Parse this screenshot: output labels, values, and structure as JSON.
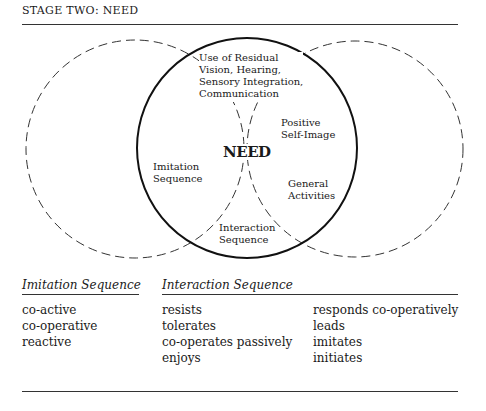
{
  "title": "STAGE TWO: NEED",
  "diagram": {
    "center_label": "NEED",
    "circles": [
      {
        "name": "imitation",
        "cx": 135,
        "cy": 149,
        "r": 109,
        "style": "dashed"
      },
      {
        "name": "need",
        "cx": 247,
        "cy": 148,
        "r": 110,
        "style": "solid"
      },
      {
        "name": "interaction",
        "cx": 355,
        "cy": 149,
        "r": 108,
        "style": "dashed"
      }
    ],
    "labels": {
      "top": [
        "Use of Residual",
        "Vision, Hearing,",
        "Sensory Integration,",
        "Communication"
      ],
      "positive": [
        "Positive",
        "Self-Image"
      ],
      "imitation": [
        "Imitation",
        "Sequence"
      ],
      "general": [
        "General",
        "Activities"
      ],
      "interaction": [
        "Interaction",
        "Sequence"
      ]
    }
  },
  "imitation_sequence": {
    "heading": "Imitation Sequence",
    "items": [
      "co-active",
      "co-operative",
      "reactive"
    ]
  },
  "interaction_sequence": {
    "heading": "Interaction Sequence",
    "column1": [
      "resists",
      "tolerates",
      "co-operates passively",
      "enjoys"
    ],
    "column2": [
      "responds co-operatively",
      "leads",
      "imitates",
      "initiates"
    ]
  }
}
